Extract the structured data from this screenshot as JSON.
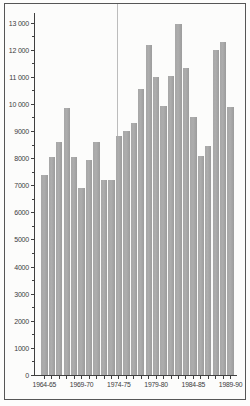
{
  "chart_data": {
    "type": "bar",
    "title": "",
    "xlabel": "",
    "ylabel": "",
    "categories": [
      "1964-65",
      "1965-66",
      "1966-67",
      "1967-68",
      "1968-69",
      "1969-70",
      "1970-71",
      "1971-72",
      "1972-73",
      "1973-74",
      "1974-75",
      "1975-76",
      "1976-77",
      "1977-78",
      "1978-79",
      "1979-80",
      "1980-81",
      "1981-82",
      "1982-83",
      "1983-84",
      "1984-85",
      "1985-86",
      "1986-87",
      "1987-88",
      "1988-89",
      "1989-90"
    ],
    "values": [
      7400,
      8050,
      8600,
      9850,
      8050,
      6900,
      7950,
      8600,
      7200,
      7200,
      8850,
      9000,
      9300,
      10550,
      12200,
      11000,
      9950,
      11050,
      12950,
      11350,
      9550,
      8100,
      8450,
      12000,
      12300,
      9900
    ],
    "ylim": [
      0,
      13000
    ],
    "grid": "off",
    "legend": "none",
    "y_axis": {
      "major_tick_step": 1000,
      "minor_tick_step": 500,
      "ticks": [
        {
          "value": 0,
          "label": "0"
        },
        {
          "value": 1000,
          "label": "1000"
        },
        {
          "value": 2000,
          "label": "2000"
        },
        {
          "value": 3000,
          "label": "3000"
        },
        {
          "value": 4000,
          "label": "4000"
        },
        {
          "value": 5000,
          "label": "5000"
        },
        {
          "value": 6000,
          "label": "6000"
        },
        {
          "value": 7000,
          "label": "7000"
        },
        {
          "value": 8000,
          "label": "8000"
        },
        {
          "value": 9000,
          "label": "9000"
        },
        {
          "value": 10000,
          "label": "10 000"
        },
        {
          "value": 11000,
          "label": "11 000"
        },
        {
          "value": 12000,
          "label": "12 000"
        },
        {
          "value": 13000,
          "label": "13 000"
        }
      ]
    },
    "x_axis": {
      "tick_every_category": true,
      "labeled_category_indexes": [
        0,
        5,
        10,
        15,
        20,
        25
      ],
      "labels_shown": [
        "1964-65",
        "1969-70",
        "1974-75",
        "1979-80",
        "1984-85",
        "1989-90"
      ]
    },
    "reference_line": {
      "category": "1974-75",
      "orientation": "vertical"
    }
  },
  "colors": {
    "bar": "#a7a7a7",
    "bar_edge": "#9c9c9c",
    "axis": "#3f3f3f",
    "text": "#3b3b3b",
    "frame_border": "#565656",
    "reference_line": "#bcbcbc",
    "background": "#fcfcfb"
  }
}
